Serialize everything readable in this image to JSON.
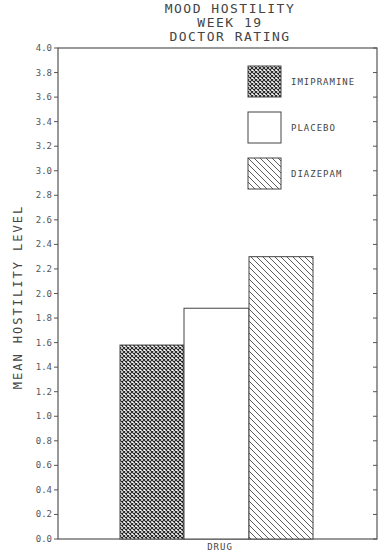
{
  "chart_data": {
    "type": "bar",
    "title": "MOOD HOSTILITY\nWEEK 19\nDOCTOR RATING",
    "title_lines": [
      "MOOD HOSTILITY",
      "WEEK 19",
      "DOCTOR RATING"
    ],
    "xlabel": "DRUG",
    "ylabel": "MEAN HOSTILITY LEVEL",
    "ylim": [
      0.0,
      4.0
    ],
    "yticks": [
      "0.0",
      "0.2",
      "0.4",
      "0.6",
      "0.8",
      "1.0",
      "1.2",
      "1.4",
      "1.6",
      "1.8",
      "2.0",
      "2.2",
      "2.4",
      "2.6",
      "2.8",
      "3.0",
      "3.2",
      "3.4",
      "3.6",
      "3.8",
      "4.0"
    ],
    "categories": [
      "IMIPRAMINE",
      "PLACEBO",
      "DIAZEPAM"
    ],
    "values": [
      1.58,
      1.88,
      2.3
    ],
    "patterns": [
      "crosshatch",
      "none",
      "diagonal"
    ],
    "legend": [
      {
        "label": "IMIPRAMINE",
        "pattern": "crosshatch"
      },
      {
        "label": "PLACEBO",
        "pattern": "none"
      },
      {
        "label": "DIAZEPAM",
        "pattern": "diagonal"
      }
    ],
    "legend_position": "upper right",
    "grid": false
  }
}
